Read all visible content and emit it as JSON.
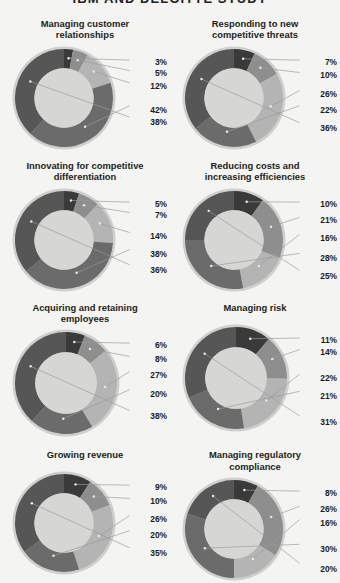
{
  "header": {
    "title": "IBM AND DELOITTE STUDY"
  },
  "palette": {
    "seg1": "#3a3a3a",
    "seg2": "#8e8e8e",
    "seg3": "#b4b4b4",
    "seg4": "#6b6b6b",
    "seg5": "#565656",
    "hole": "#d6d6d4",
    "rim": "#cfcfcd",
    "background": "#f4f4f2",
    "label_text": "#1c1c1c",
    "leader_line": "#9a9a9a"
  },
  "chart_data": [
    {
      "type": "pie",
      "title": "Managing customer relationships",
      "labels": [
        "3%",
        "5%",
        "12%",
        "42%",
        "38%"
      ],
      "values": [
        3,
        5,
        12,
        42,
        38
      ],
      "legend": "none",
      "donut": true
    },
    {
      "type": "pie",
      "title": "Responding to new competitive threats",
      "labels": [
        "7%",
        "10%",
        "26%",
        "22%",
        "36%"
      ],
      "values": [
        7,
        10,
        26,
        22,
        36
      ],
      "legend": "none",
      "donut": true
    },
    {
      "type": "pie",
      "title": "Innovating for competitive differentiation",
      "labels": [
        "5%",
        "7%",
        "14%",
        "38%",
        "36%"
      ],
      "values": [
        5,
        7,
        14,
        38,
        36
      ],
      "legend": "none",
      "donut": true
    },
    {
      "type": "pie",
      "title": "Reducing costs and increasing efficiencies",
      "labels": [
        "10%",
        "21%",
        "16%",
        "28%",
        "25%"
      ],
      "values": [
        10,
        21,
        16,
        28,
        25
      ],
      "legend": "none",
      "donut": true
    },
    {
      "type": "pie",
      "title": "Acquiring and retaining employees",
      "labels": [
        "6%",
        "8%",
        "27%",
        "20%",
        "38%"
      ],
      "values": [
        6,
        8,
        27,
        20,
        38
      ],
      "legend": "none",
      "donut": true
    },
    {
      "type": "pie",
      "title": "Managing risk",
      "labels": [
        "11%",
        "14%",
        "22%",
        "21%",
        "31%"
      ],
      "values": [
        11,
        14,
        22,
        21,
        31
      ],
      "legend": "none",
      "donut": true
    },
    {
      "type": "pie",
      "title": "Growing revenue",
      "labels": [
        "9%",
        "10%",
        "26%",
        "20%",
        "35%"
      ],
      "values": [
        9,
        10,
        26,
        20,
        35
      ],
      "legend": "none",
      "donut": true
    },
    {
      "type": "pie",
      "title": "Managing regulatory compliance",
      "labels": [
        "8%",
        "26%",
        "16%",
        "30%",
        "20%"
      ],
      "values": [
        8,
        26,
        16,
        30,
        20
      ],
      "legend": "none",
      "donut": true
    }
  ],
  "label_y_positions": [
    [
      14,
      25,
      38,
      62,
      74
    ],
    [
      14,
      27,
      46,
      62,
      80
    ],
    [
      14,
      25,
      46,
      64,
      80
    ],
    [
      14,
      30,
      48,
      68,
      86
    ],
    [
      14,
      28,
      44,
      63,
      85
    ],
    [
      14,
      26,
      52,
      70,
      96
    ],
    [
      14,
      28,
      46,
      62,
      80
    ],
    [
      14,
      30,
      44,
      70,
      90
    ]
  ]
}
